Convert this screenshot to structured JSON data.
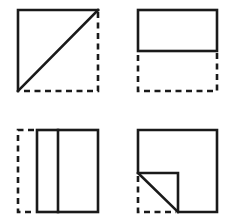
{
  "diagram": {
    "title": "",
    "stroke_color": "#1a1a1a",
    "background": "#ffffff",
    "panels": [
      {
        "id": "A",
        "position": "top-left",
        "fold_type": "diagonal fold (lower-left triangle folded onto upper-left)",
        "solid_shapes": [
          "top edge",
          "left edge",
          "diagonal from top-right to bottom-left"
        ],
        "dashed_shapes": [
          "right edge",
          "bottom edge"
        ]
      },
      {
        "id": "B",
        "position": "top-right",
        "fold_type": "horizontal half fold (bottom folded up)",
        "solid_shapes": [
          "upper half rectangle"
        ],
        "dashed_shapes": [
          "lower half left edge",
          "lower half right edge",
          "bottom edge"
        ]
      },
      {
        "id": "C",
        "position": "bottom-left",
        "fold_type": "vertical strip fold (left strip folded over)",
        "solid_shapes": [
          "rectangle minus left strip",
          "inner vertical fold line"
        ],
        "dashed_shapes": [
          "left edge of original",
          "top-left short segment",
          "bottom-left short segment"
        ]
      },
      {
        "id": "D",
        "position": "bottom-right",
        "fold_type": "corner fold (bottom-left corner folded up-right)",
        "solid_shapes": [
          "outer outline with notch",
          "diagonal fold line"
        ],
        "dashed_shapes": [
          "bottom-left corner original outline"
        ]
      }
    ]
  }
}
